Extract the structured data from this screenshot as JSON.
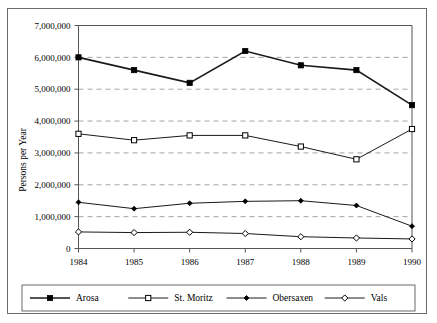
{
  "chart_data": {
    "type": "line",
    "title": "",
    "xlabel": "",
    "ylabel": "Persons per Year",
    "categories": [
      "1984",
      "1985",
      "1986",
      "1987",
      "1988",
      "1989",
      "1990"
    ],
    "x": [
      1984,
      1985,
      1986,
      1987,
      1988,
      1989,
      1990
    ],
    "ylim": [
      0,
      7000000
    ],
    "ytick_labels": [
      "0",
      "1,000,000",
      "2,000,000",
      "3,000,000",
      "4,000,000",
      "5,000,000",
      "6,000,000",
      "7,000,000"
    ],
    "ytick_values": [
      0,
      1000000,
      2000000,
      3000000,
      4000000,
      5000000,
      6000000,
      7000000
    ],
    "grid": "horizontal-dashed",
    "legend_position": "bottom",
    "series": [
      {
        "name": "Arosa",
        "marker": "filled-square",
        "color": "#000000",
        "values": [
          6000000,
          5600000,
          5200000,
          6200000,
          5750000,
          5600000,
          4500000
        ]
      },
      {
        "name": "St. Moritz",
        "marker": "open-square",
        "color": "#000000",
        "values": [
          3600000,
          3400000,
          3550000,
          3550000,
          3200000,
          2800000,
          3750000
        ]
      },
      {
        "name": "Obersaxen",
        "marker": "filled-diamond",
        "color": "#000000",
        "values": [
          1450000,
          1250000,
          1420000,
          1480000,
          1500000,
          1350000,
          700000
        ]
      },
      {
        "name": "Vals",
        "marker": "open-diamond",
        "color": "#000000",
        "values": [
          520000,
          500000,
          510000,
          470000,
          370000,
          330000,
          300000
        ]
      }
    ]
  },
  "axes": {
    "y_title": "Persons per Year"
  },
  "legend": {
    "entries": [
      {
        "label": "Arosa"
      },
      {
        "label": "St. Moritz"
      },
      {
        "label": "Obersaxen"
      },
      {
        "label": "Vals"
      }
    ]
  },
  "colors": {
    "line": "#1a1a1a",
    "grid": "#9a9a9a",
    "axis": "#555555",
    "frame": "#6b6b6b"
  }
}
